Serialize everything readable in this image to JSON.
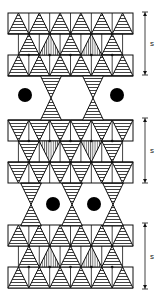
{
  "figure": {
    "colors": {
      "line": "#111111",
      "cation": "#000000",
      "background": "#ffffff"
    },
    "blocks": [
      {
        "id": "layer-1",
        "top": 13,
        "orientation": "up",
        "spacing_label": "s"
      },
      {
        "id": "layer-2",
        "top": 120,
        "orientation": "down",
        "spacing_label": "s"
      },
      {
        "id": "layer-3",
        "top": 225,
        "orientation": "up",
        "spacing_label": "s"
      }
    ],
    "interlayers": [
      {
        "id": "interlayer-1",
        "bowties_x": [
          51,
          93
        ],
        "cations_x": [
          25,
          117
        ],
        "cation_y": 95,
        "top": 76,
        "bottom": 120
      },
      {
        "id": "interlayer-2",
        "bowties_x": [
          31,
          72,
          113
        ],
        "cations_x": [
          53,
          94
        ],
        "cation_y": 204,
        "top": 183,
        "bottom": 226
      }
    ],
    "labels": {
      "s1": "s",
      "s2": "s",
      "s3": "s"
    }
  }
}
